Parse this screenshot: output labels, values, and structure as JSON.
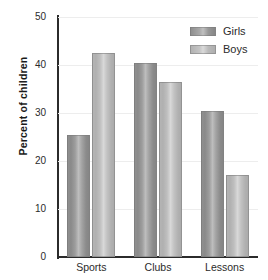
{
  "chart_data": {
    "type": "bar",
    "title": "",
    "xlabel": "",
    "ylabel": "Percent of children",
    "ylim": [
      0,
      50
    ],
    "yticks": [
      0,
      10,
      20,
      30,
      40,
      50
    ],
    "ytick_labels": [
      "0",
      "10",
      "20",
      "30",
      "40",
      "50"
    ],
    "categories": [
      "Sports",
      "Clubs",
      "Lessons"
    ],
    "series": [
      {
        "name": "Girls",
        "color": "#8d8d8d",
        "values": [
          25.5,
          40.5,
          30.5
        ]
      },
      {
        "name": "Boys",
        "color": "#b2b2b2",
        "values": [
          42.5,
          36.5,
          17.0
        ]
      }
    ],
    "legend_position": "top-right",
    "grid": true,
    "grid_axis": "y",
    "bar_style": "cylindrical-gradient"
  },
  "legend": {
    "entries": [
      {
        "label": "Girls",
        "swatch": "girls-swatch"
      },
      {
        "label": "Boys",
        "swatch": "boys-swatch"
      }
    ]
  },
  "axes": {
    "y_title": "Percent of children",
    "y_labels": [
      "50",
      "40",
      "30",
      "20",
      "10",
      "0"
    ],
    "x_labels": [
      "Sports",
      "Clubs",
      "Lessons"
    ]
  }
}
